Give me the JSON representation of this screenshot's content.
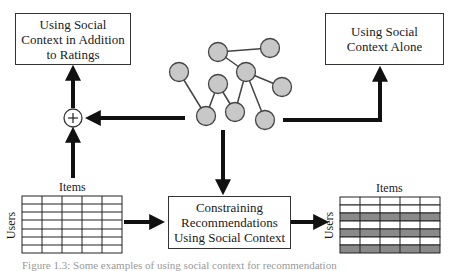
{
  "boxes": {
    "top_left": {
      "lines": [
        "Using Social",
        "Context in Addition",
        "to Ratings"
      ]
    },
    "top_right": {
      "lines": [
        "Using Social",
        "Context Alone"
      ]
    },
    "center": {
      "lines": [
        "Constraining",
        "Recommendations",
        "Using Social Context"
      ]
    }
  },
  "matrices": {
    "left": {
      "col_label": "Items",
      "row_label": "Users",
      "rows": 7,
      "cols": 5,
      "shaded_rows": []
    },
    "right": {
      "col_label": "Items",
      "row_label": "Users",
      "rows": 7,
      "cols": 5,
      "shaded_rows": [
        2,
        4,
        6
      ]
    }
  },
  "combiner": {
    "symbol": "+"
  },
  "network": {
    "node_color": "#c8c8c8",
    "nodes": [
      {
        "id": "A",
        "x": 218,
        "y": 52
      },
      {
        "id": "B",
        "x": 270,
        "y": 48
      },
      {
        "id": "C",
        "x": 179,
        "y": 72
      },
      {
        "id": "D",
        "x": 246,
        "y": 72
      },
      {
        "id": "E",
        "x": 218,
        "y": 84
      },
      {
        "id": "F",
        "x": 282,
        "y": 87
      },
      {
        "id": "G",
        "x": 206,
        "y": 116
      },
      {
        "id": "H",
        "x": 235,
        "y": 112
      },
      {
        "id": "I",
        "x": 265,
        "y": 120
      }
    ],
    "edges": [
      [
        "A",
        "B"
      ],
      [
        "A",
        "D"
      ],
      [
        "D",
        "F"
      ],
      [
        "D",
        "H"
      ],
      [
        "D",
        "I"
      ],
      [
        "C",
        "G"
      ],
      [
        "G",
        "E"
      ],
      [
        "E",
        "H"
      ]
    ]
  },
  "caption": "Figure 1.3: Some examples of using social context for recommendation"
}
